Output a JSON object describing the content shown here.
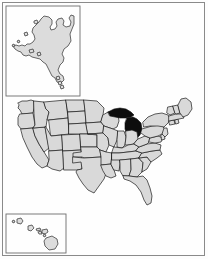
{
  "figure": {
    "kind": "choropleth-map",
    "region": "United States",
    "highlighted_state": "Michigan",
    "background_color": "#fdfdfd",
    "frame_color": "#8a8a8a",
    "state_fill_color": "#d9d9d9",
    "state_border_color": "#1a1a1a",
    "highlight_fill_color": "#0d0d0d",
    "inset_border_color": "#6e6e6e"
  },
  "insets": [
    {
      "name": "alaska-inset",
      "label": "Alaska"
    },
    {
      "name": "hawaii-inset",
      "label": "Hawaii"
    }
  ],
  "states": [
    {
      "code": "WA",
      "name": "Washington",
      "highlighted": false
    },
    {
      "code": "OR",
      "name": "Oregon",
      "highlighted": false
    },
    {
      "code": "CA",
      "name": "California",
      "highlighted": false
    },
    {
      "code": "NV",
      "name": "Nevada",
      "highlighted": false
    },
    {
      "code": "ID",
      "name": "Idaho",
      "highlighted": false
    },
    {
      "code": "MT",
      "name": "Montana",
      "highlighted": false
    },
    {
      "code": "WY",
      "name": "Wyoming",
      "highlighted": false
    },
    {
      "code": "UT",
      "name": "Utah",
      "highlighted": false
    },
    {
      "code": "AZ",
      "name": "Arizona",
      "highlighted": false
    },
    {
      "code": "CO",
      "name": "Colorado",
      "highlighted": false
    },
    {
      "code": "NM",
      "name": "New Mexico",
      "highlighted": false
    },
    {
      "code": "ND",
      "name": "North Dakota",
      "highlighted": false
    },
    {
      "code": "SD",
      "name": "South Dakota",
      "highlighted": false
    },
    {
      "code": "NE",
      "name": "Nebraska",
      "highlighted": false
    },
    {
      "code": "KS",
      "name": "Kansas",
      "highlighted": false
    },
    {
      "code": "OK",
      "name": "Oklahoma",
      "highlighted": false
    },
    {
      "code": "TX",
      "name": "Texas",
      "highlighted": false
    },
    {
      "code": "MN",
      "name": "Minnesota",
      "highlighted": false
    },
    {
      "code": "IA",
      "name": "Iowa",
      "highlighted": false
    },
    {
      "code": "MO",
      "name": "Missouri",
      "highlighted": false
    },
    {
      "code": "AR",
      "name": "Arkansas",
      "highlighted": false
    },
    {
      "code": "LA",
      "name": "Louisiana",
      "highlighted": false
    },
    {
      "code": "WI",
      "name": "Wisconsin",
      "highlighted": false
    },
    {
      "code": "IL",
      "name": "Illinois",
      "highlighted": false
    },
    {
      "code": "MS",
      "name": "Mississippi",
      "highlighted": false
    },
    {
      "code": "MI",
      "name": "Michigan",
      "highlighted": true
    },
    {
      "code": "IN",
      "name": "Indiana",
      "highlighted": false
    },
    {
      "code": "OH",
      "name": "Ohio",
      "highlighted": false
    },
    {
      "code": "KY",
      "name": "Kentucky",
      "highlighted": false
    },
    {
      "code": "TN",
      "name": "Tennessee",
      "highlighted": false
    },
    {
      "code": "AL",
      "name": "Alabama",
      "highlighted": false
    },
    {
      "code": "GA",
      "name": "Georgia",
      "highlighted": false
    },
    {
      "code": "FL",
      "name": "Florida",
      "highlighted": false
    },
    {
      "code": "SC",
      "name": "South Carolina",
      "highlighted": false
    },
    {
      "code": "NC",
      "name": "North Carolina",
      "highlighted": false
    },
    {
      "code": "VA",
      "name": "Virginia",
      "highlighted": false
    },
    {
      "code": "WV",
      "name": "West Virginia",
      "highlighted": false
    },
    {
      "code": "MD",
      "name": "Maryland",
      "highlighted": false
    },
    {
      "code": "DE",
      "name": "Delaware",
      "highlighted": false
    },
    {
      "code": "NJ",
      "name": "New Jersey",
      "highlighted": false
    },
    {
      "code": "PA",
      "name": "Pennsylvania",
      "highlighted": false
    },
    {
      "code": "NY",
      "name": "New York",
      "highlighted": false
    },
    {
      "code": "CT",
      "name": "Connecticut",
      "highlighted": false
    },
    {
      "code": "RI",
      "name": "Rhode Island",
      "highlighted": false
    },
    {
      "code": "MA",
      "name": "Massachusetts",
      "highlighted": false
    },
    {
      "code": "VT",
      "name": "Vermont",
      "highlighted": false
    },
    {
      "code": "NH",
      "name": "New Hampshire",
      "highlighted": false
    },
    {
      "code": "ME",
      "name": "Maine",
      "highlighted": false
    },
    {
      "code": "AK",
      "name": "Alaska",
      "highlighted": false
    },
    {
      "code": "HI",
      "name": "Hawaii",
      "highlighted": false
    }
  ]
}
